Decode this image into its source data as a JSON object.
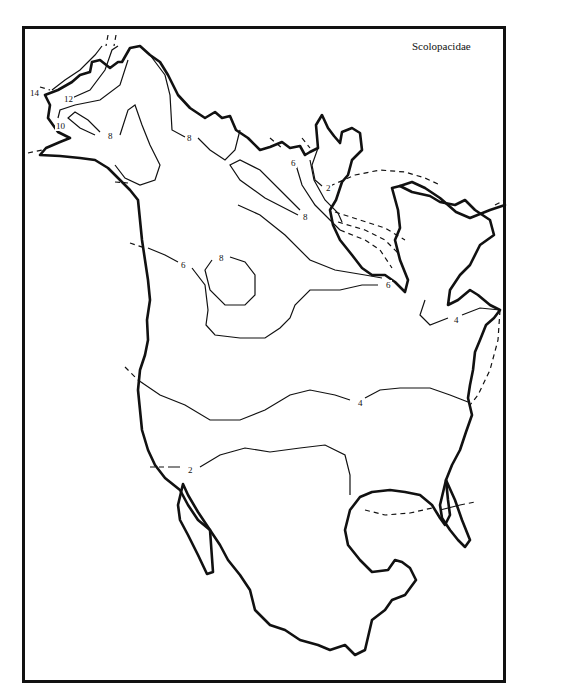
{
  "map": {
    "title": "Scolopacidae",
    "type": "isoline species-richness map",
    "region": "North America",
    "contour_labels": [
      {
        "id": "c14",
        "value": "14",
        "x": 29,
        "y": 88
      },
      {
        "id": "c12",
        "value": "12",
        "x": 63,
        "y": 94
      },
      {
        "id": "c10",
        "value": "10",
        "x": 55,
        "y": 121
      },
      {
        "id": "c8a",
        "value": "8",
        "x": 107,
        "y": 131
      },
      {
        "id": "c8b",
        "value": "8",
        "x": 186,
        "y": 133
      },
      {
        "id": "c6a",
        "value": "6",
        "x": 290,
        "y": 158
      },
      {
        "id": "c2a",
        "value": "2",
        "x": 325,
        "y": 183
      },
      {
        "id": "c8c",
        "value": "8",
        "x": 302,
        "y": 212
      },
      {
        "id": "c8d",
        "value": "8",
        "x": 218,
        "y": 253
      },
      {
        "id": "c6b",
        "value": "6",
        "x": 180,
        "y": 260
      },
      {
        "id": "c6c",
        "value": "6",
        "x": 385,
        "y": 280
      },
      {
        "id": "c4a",
        "value": "4",
        "x": 453,
        "y": 315
      },
      {
        "id": "c4b",
        "value": "4",
        "x": 357,
        "y": 398
      },
      {
        "id": "c2b",
        "value": "2",
        "x": 187,
        "y": 465
      }
    ]
  }
}
